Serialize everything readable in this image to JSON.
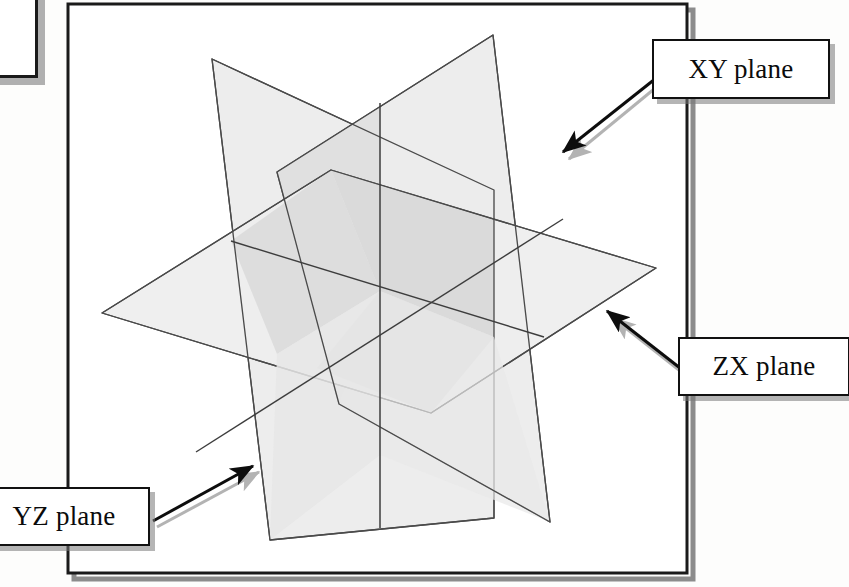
{
  "page": {
    "width": 849,
    "height": 587,
    "background_color": "#fdfdfc"
  },
  "frame": {
    "name": "figure-border",
    "stroke_color": "#1a1a1a",
    "stroke_width": 3,
    "x": 68,
    "y": 4,
    "width": 619,
    "height": 569,
    "shadow_color": "#8c8c8c"
  },
  "diagram": {
    "type": "isometric-planes",
    "origin": {
      "x": 380,
      "y": 291
    },
    "plane_stroke": "#4a4a4a",
    "plane_stroke_width": 1.3,
    "fill_light": "#efefef",
    "fill_mid": "#e2e2e2",
    "fill_dark": "#d2d2d2",
    "planes": [
      {
        "id": "xy",
        "label": "XY plane",
        "orientation": "vertical-right-facing",
        "fill": "#ececec",
        "vertices": [
          {
            "x": 277,
            "y": 172
          },
          {
            "x": 493,
            "y": 35
          },
          {
            "x": 550,
            "y": 522
          },
          {
            "x": 339,
            "y": 404
          }
        ]
      },
      {
        "id": "zx",
        "label": "ZX plane",
        "orientation": "horizontal",
        "fill": "#eeeeee",
        "vertices": [
          {
            "x": 102,
            "y": 313
          },
          {
            "x": 331,
            "y": 170
          },
          {
            "x": 656,
            "y": 268
          },
          {
            "x": 431,
            "y": 413
          }
        ]
      },
      {
        "id": "yz",
        "label": "YZ plane",
        "orientation": "vertical-left-facing",
        "fill": "#ededed",
        "vertices": [
          {
            "x": 212,
            "y": 59
          },
          {
            "x": 494,
            "y": 190
          },
          {
            "x": 494,
            "y": 518
          },
          {
            "x": 270,
            "y": 540
          }
        ]
      }
    ]
  },
  "callouts": [
    {
      "id": "xy",
      "label": "XY plane",
      "box": {
        "x": 652,
        "y": 39,
        "width": 178,
        "height": 60
      },
      "arrow": {
        "from": {
          "x": 655,
          "y": 79
        },
        "to": {
          "x": 562,
          "y": 152
        },
        "color": "#0d0d0d",
        "shadow_color": "#b3b3b3"
      }
    },
    {
      "id": "zx",
      "label": "ZX plane",
      "box": {
        "x": 678,
        "y": 337,
        "width": 172,
        "height": 59
      },
      "arrow": {
        "from": {
          "x": 680,
          "y": 368
        },
        "to": {
          "x": 607,
          "y": 311
        },
        "color": "#0d0d0d",
        "shadow_color": "#b3b3b3"
      }
    },
    {
      "id": "yz",
      "label": "YZ plane",
      "box": {
        "x": -22,
        "y": 487,
        "width": 172,
        "height": 59
      },
      "arrow": {
        "from": {
          "x": 153,
          "y": 521
        },
        "to": {
          "x": 253,
          "y": 466
        },
        "color": "#0d0d0d",
        "shadow_color": "#b3b3b3"
      }
    }
  ],
  "corner_fragment": {
    "name": "clipped-callout-box",
    "x": -60,
    "y": -52,
    "width": 98,
    "height": 130
  }
}
